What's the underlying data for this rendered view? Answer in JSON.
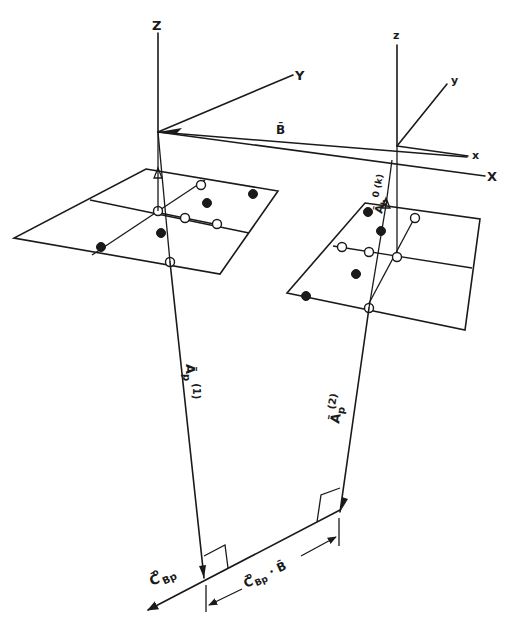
{
  "figure": {
    "type": "3D vector geometry diagram",
    "background": "#ffffff",
    "ink_color": "#1a1a1a"
  },
  "global_axes": {
    "labels": {
      "z": "Z",
      "y": "Y",
      "x": "X"
    }
  },
  "local_axes": {
    "labels": {
      "z": "z",
      "y": "y",
      "x": "x"
    }
  },
  "vectors": {
    "baseline": "B̄",
    "ap1": {
      "base": "Ā",
      "sub": "p",
      "sup": "(1)"
    },
    "ap2": {
      "base": "Ā",
      "sub": "p",
      "sup": "(2)"
    },
    "ab0": {
      "base": "Ā",
      "sub": "b",
      "sup": "0 (k)"
    },
    "cbp": {
      "base": "C̄",
      "sup": "o",
      "sub": "Bp"
    },
    "projection": {
      "base": "C̄",
      "sup": "o",
      "sub": "Bp",
      "suffix": " · B̄"
    }
  },
  "panels": [
    {
      "name": "left-photo-plane",
      "points": 8
    },
    {
      "name": "right-photo-plane",
      "points": 8
    }
  ]
}
